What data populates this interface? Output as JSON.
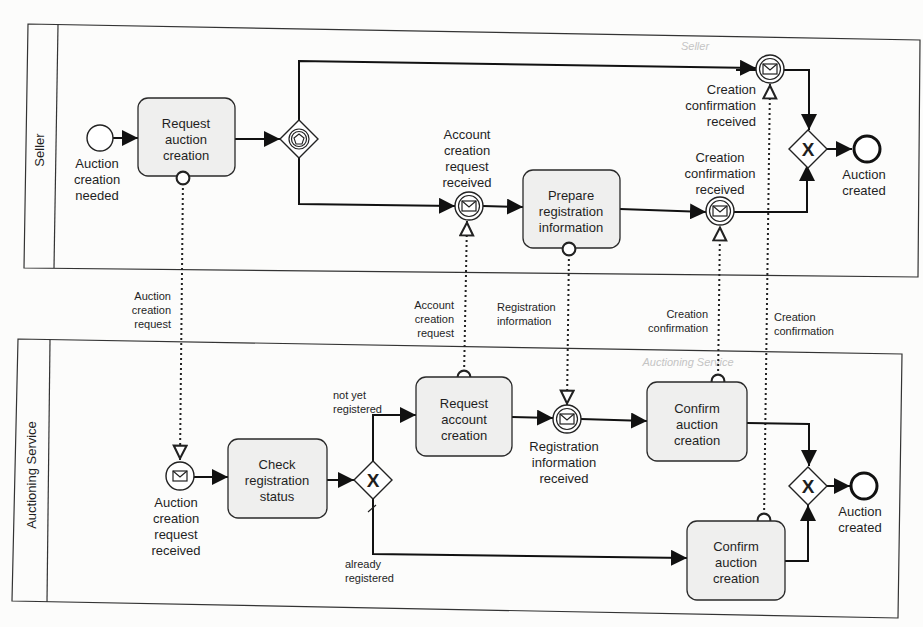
{
  "pools": {
    "seller": {
      "label": "Seller",
      "watermark": "Seller"
    },
    "service": {
      "label": "Auctioning Service",
      "watermark": "Auctioning Service"
    }
  },
  "seller": {
    "start_event": "Auction creation needed",
    "task_request": "Request auction creation",
    "gateway": "event-based gateway",
    "event_account_req": "Account creation request received",
    "task_prepare": "Prepare registration information",
    "event_conf_top": "Creation confirmation received",
    "event_conf_mid": "Creation confirmation received",
    "gateway_join": "X",
    "end_event": "Auction created"
  },
  "service": {
    "start_event": "Auction creation request received",
    "task_check": "Check registration status",
    "gateway": "X",
    "flow_not_yet": "not yet registered",
    "flow_already": "already registered",
    "task_request_account": "Request account creation",
    "event_reg_info": "Registration information received",
    "task_confirm_top": "Confirm auction creation",
    "task_confirm_bottom": "Confirm auction creation",
    "gateway_join": "X",
    "end_event": "Auction created"
  },
  "messages": {
    "auction_request": "Auction creation request",
    "account_request": "Account creation request",
    "registration_info": "Registration information",
    "confirmation_1": "Creation confirmation",
    "confirmation_2": "Creation confirmation"
  }
}
